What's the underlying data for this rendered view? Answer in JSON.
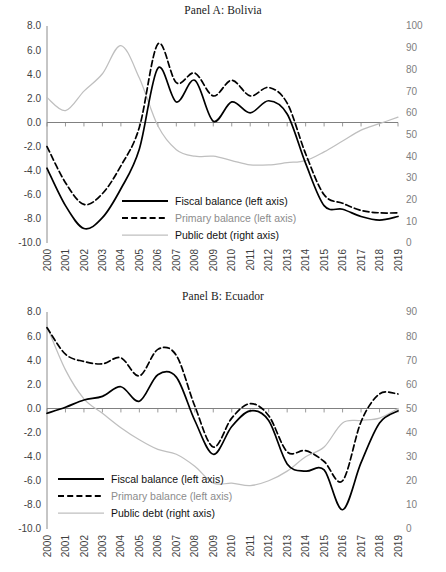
{
  "figure": {
    "width": 446,
    "height": 572,
    "background": "#ffffff"
  },
  "colors": {
    "fiscal_balance": "#000000",
    "primary_balance": "#000000",
    "public_debt": "#bfbfbf",
    "axis": "#808080",
    "left_tick_text": "#3f3f3f",
    "right_tick_text": "#808080",
    "title_text": "#1a1a1a"
  },
  "legend": {
    "items": [
      {
        "label": "Fiscal balance (left axis)",
        "style": "solid",
        "color": "#000000",
        "muted": false
      },
      {
        "label": "Primary balance (left axis)",
        "style": "dashed",
        "color": "#000000",
        "muted": true
      },
      {
        "label": "Public debt (right axis)",
        "style": "solid",
        "color": "#bfbfbf",
        "muted": false
      }
    ]
  },
  "chart_data": [
    {
      "panel": "A",
      "type": "line",
      "title": "Panel A: Bolivia",
      "xlabel": "",
      "ylabel": "",
      "grid": false,
      "legend_position": "inside-bottom-left",
      "x": [
        2000,
        2001,
        2002,
        2003,
        2004,
        2005,
        2006,
        2007,
        2008,
        2009,
        2010,
        2011,
        2012,
        2013,
        2014,
        2015,
        2016,
        2017,
        2018,
        2019
      ],
      "categories": [
        "2000",
        "2001",
        "2002",
        "2003",
        "2004",
        "2005",
        "2006",
        "2007",
        "2008",
        "2009",
        "2010",
        "2011",
        "2012",
        "2013",
        "2014",
        "2015",
        "2016",
        "2017",
        "2018",
        "2019"
      ],
      "left_axis": {
        "ticks": [
          "-10.0",
          "-8.0",
          "-6.0",
          "-4.0",
          "-2.0",
          "0.0",
          "2.0",
          "4.0",
          "6.0",
          "8.0"
        ],
        "ylim": [
          -10.0,
          8.0
        ],
        "step": 2.0
      },
      "right_axis": {
        "ticks": [
          "0",
          "10",
          "20",
          "30",
          "40",
          "50",
          "60",
          "70",
          "80",
          "90",
          "100"
        ],
        "ylim": [
          0,
          100
        ],
        "step": 10
      },
      "series": [
        {
          "name": "Fiscal balance (left axis)",
          "axis": "left",
          "style": "solid",
          "color": "#000000",
          "values": [
            -3.8,
            -6.9,
            -8.8,
            -7.9,
            -5.5,
            -2.2,
            4.5,
            1.7,
            3.5,
            0.1,
            1.7,
            0.8,
            1.8,
            0.7,
            -3.4,
            -6.9,
            -7.2,
            -7.8,
            -8.1,
            -7.8
          ]
        },
        {
          "name": "Primary balance (left axis)",
          "axis": "left",
          "style": "dashed",
          "color": "#000000",
          "values": [
            -2.0,
            -5.0,
            -6.8,
            -5.9,
            -3.6,
            -0.4,
            6.5,
            3.3,
            4.1,
            2.2,
            3.5,
            2.2,
            2.9,
            1.6,
            -2.6,
            -6.0,
            -6.7,
            -7.3,
            -7.5,
            -7.5
          ]
        },
        {
          "name": "Public debt (right axis)",
          "axis": "right",
          "style": "solid",
          "color": "#bfbfbf",
          "values": [
            67,
            61,
            70,
            78,
            91,
            76,
            54,
            43,
            40,
            40,
            38,
            36,
            36,
            37,
            38,
            42,
            47,
            52,
            55,
            58
          ]
        }
      ]
    },
    {
      "panel": "B",
      "type": "line",
      "title": "Panel B: Ecuador",
      "xlabel": "",
      "ylabel": "",
      "grid": false,
      "legend_position": "inside-bottom-left",
      "x": [
        2000,
        2001,
        2002,
        2003,
        2004,
        2005,
        2006,
        2007,
        2008,
        2009,
        2010,
        2011,
        2012,
        2013,
        2014,
        2015,
        2016,
        2017,
        2018,
        2019
      ],
      "categories": [
        "2000",
        "2001",
        "2002",
        "2003",
        "2004",
        "2005",
        "2006",
        "2007",
        "2008",
        "2009",
        "2010",
        "2011",
        "2012",
        "2013",
        "2014",
        "2015",
        "2016",
        "2017",
        "2018",
        "2019"
      ],
      "left_axis": {
        "ticks": [
          "-10.0",
          "-8.0",
          "-6.0",
          "-4.0",
          "-2.0",
          "0.0",
          "2.0",
          "4.0",
          "6.0",
          "8.0"
        ],
        "ylim": [
          -10.0,
          8.0
        ],
        "step": 2.0
      },
      "right_axis": {
        "ticks": [
          "0",
          "10",
          "20",
          "30",
          "40",
          "50",
          "60",
          "70",
          "80",
          "90"
        ],
        "ylim": [
          0,
          90
        ],
        "step": 10
      },
      "series": [
        {
          "name": "Fiscal balance (left axis)",
          "axis": "left",
          "style": "solid",
          "color": "#000000",
          "values": [
            -0.4,
            0.1,
            0.7,
            1.0,
            1.8,
            0.6,
            2.8,
            2.6,
            -1.0,
            -3.8,
            -1.5,
            -0.2,
            -1.0,
            -4.6,
            -5.2,
            -5.1,
            -8.4,
            -4.5,
            -1.2,
            -0.2
          ]
        },
        {
          "name": "Primary balance (left axis)",
          "axis": "left",
          "style": "dashed",
          "color": "#000000",
          "values": [
            6.7,
            4.5,
            3.9,
            3.7,
            4.2,
            2.7,
            4.9,
            4.4,
            0.2,
            -3.2,
            -0.8,
            0.4,
            -0.6,
            -3.6,
            -3.5,
            -4.4,
            -6.0,
            -1.1,
            1.2,
            1.2
          ]
        },
        {
          "name": "Public debt (right axis)",
          "axis": "right",
          "style": "solid",
          "color": "#bfbfbf",
          "values": [
            84,
            66,
            54,
            48,
            42,
            37,
            33,
            31,
            26,
            19,
            19,
            18,
            20,
            24,
            30,
            34,
            44,
            45,
            46,
            50
          ]
        }
      ]
    }
  ]
}
